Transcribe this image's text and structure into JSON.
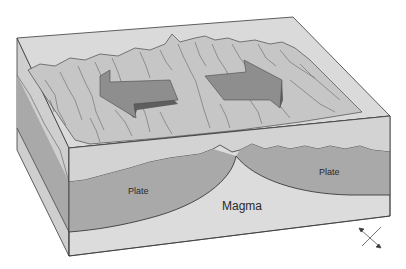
{
  "diagram": {
    "type": "block-diagram",
    "labels": {
      "plate_left": "Plate",
      "plate_right": "Plate",
      "magma": "Magma"
    },
    "arrows": [
      {
        "direction": "left",
        "meaning": "plate moving away"
      },
      {
        "direction": "right",
        "meaning": "plate moving away"
      }
    ],
    "orientation_symbol": "diagonal double-headed arrow",
    "colors": {
      "background": "#ffffff",
      "box_top": "#d6d6d6",
      "terrain": "#c9c9c9",
      "plate": "#a9a9a9",
      "magma": "#dcdcdc",
      "crust_band": "#d0d0d0",
      "arrow_fill": "#8e8e8e",
      "arrow_side": "#5e5e5e",
      "line": "#3a3a3a"
    }
  }
}
